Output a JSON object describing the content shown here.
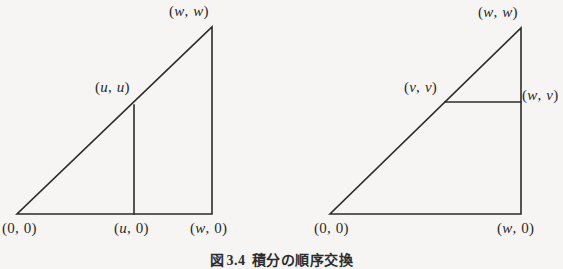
{
  "figure": {
    "caption_prefix": "図",
    "caption_number": "3.4",
    "caption_text": "積分の順序交換",
    "line_color": "#2b2b2d",
    "background_color": "#f6f5f3",
    "text_color": "#2a2a2c"
  },
  "left_diagram": {
    "name": "inner-integral-over-u",
    "vertices": {
      "origin": {
        "label": "(0, 0)",
        "x": 17,
        "y": 214
      },
      "base_right": {
        "label": "(w, 0)",
        "x": 212,
        "y": 214
      },
      "apex": {
        "label": "(w, w)",
        "x": 212,
        "y": 27
      }
    },
    "cut": {
      "type": "vertical",
      "x": 134,
      "top_label": "(u, u)",
      "bottom_label": "(u, 0)",
      "top_y": 105,
      "bottom_y": 214
    },
    "labels": {
      "apex": {
        "text_parts": [
          "(",
          "w",
          ",",
          "w",
          ")"
        ],
        "left": 169,
        "top": 4
      },
      "cut_top": {
        "text_parts": [
          "(",
          "u",
          ",",
          "u",
          ")"
        ],
        "left": 95,
        "top": 80
      },
      "origin": {
        "text_parts": [
          "(",
          "0",
          ",",
          "0",
          ")"
        ],
        "left": 2,
        "top": 221
      },
      "cut_bottom": {
        "text_parts": [
          "(",
          "u",
          ",",
          "0",
          ")"
        ],
        "left": 114,
        "top": 221
      },
      "base_right": {
        "text_parts": [
          "(",
          "w",
          ",",
          "0",
          ")"
        ],
        "left": 190,
        "top": 221
      }
    }
  },
  "right_diagram": {
    "name": "inner-integral-over-v",
    "vertices": {
      "origin": {
        "label": "(0, 0)",
        "x": 330,
        "y": 214
      },
      "base_right": {
        "label": "(w, 0)",
        "x": 521,
        "y": 214
      },
      "apex": {
        "label": "(w, w)",
        "x": 521,
        "y": 28
      }
    },
    "cut": {
      "type": "horizontal",
      "y": 102,
      "left_label": "(v, v)",
      "right_label": "(w, v)",
      "left_x": 445,
      "right_x": 521
    },
    "labels": {
      "apex": {
        "text_parts": [
          "(",
          "w",
          ",",
          "w",
          ")"
        ],
        "left": 478,
        "top": 5
      },
      "cut_left": {
        "text_parts": [
          "(",
          "v",
          ",",
          "v",
          ")"
        ],
        "left": 404,
        "top": 80
      },
      "cut_right": {
        "text_parts": [
          "(",
          "w",
          ",",
          "v",
          ")"
        ],
        "left": 522,
        "top": 88
      },
      "origin": {
        "text_parts": [
          "(",
          "0",
          ",",
          "0",
          ")"
        ],
        "left": 314,
        "top": 221
      },
      "base_right": {
        "text_parts": [
          "(",
          "w",
          ",",
          "0",
          ")"
        ],
        "left": 497,
        "top": 221
      }
    }
  }
}
